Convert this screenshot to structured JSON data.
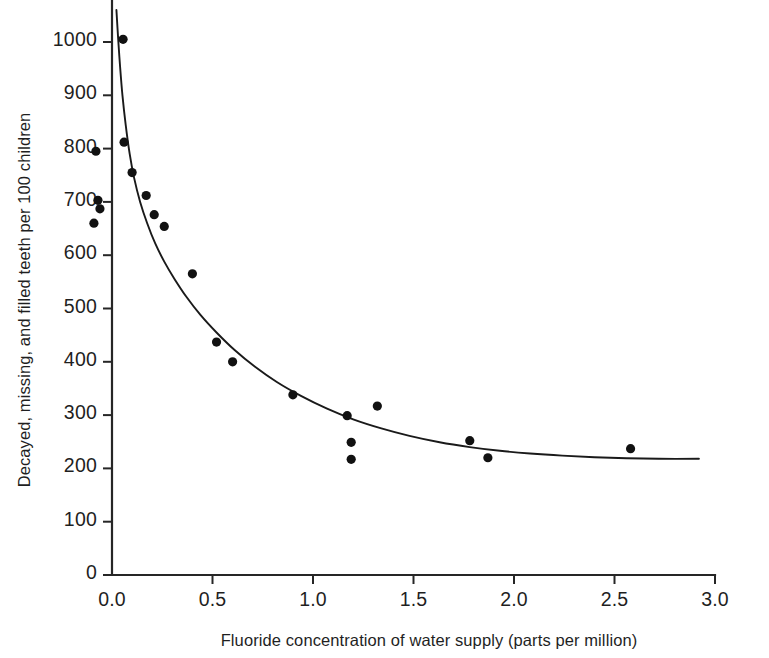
{
  "chart_data": {
    "type": "scatter",
    "title": "",
    "xlabel": "Fluoride concentration of water supply (parts per million)",
    "ylabel": "Decayed, missing, and filled teeth per 100 children",
    "xlim": [
      -0.13,
      3.0
    ],
    "ylim": [
      0,
      1060
    ],
    "grid": false,
    "legend": "none",
    "xticks": [
      0.0,
      0.5,
      1.0,
      1.5,
      2.0,
      2.5,
      3.0
    ],
    "xtick_labels": [
      "0.0",
      "0.5",
      "1.0",
      "1.5",
      "2.0",
      "2.5",
      "3.0"
    ],
    "yticks": [
      0,
      100,
      200,
      300,
      400,
      500,
      600,
      700,
      800,
      900,
      1000
    ],
    "ytick_labels": [
      "0",
      "100",
      "200",
      "300",
      "400",
      "500",
      "600",
      "700",
      "800",
      "900",
      "1000"
    ],
    "x": [
      -0.09,
      -0.08,
      -0.07,
      -0.06,
      0.055,
      0.06,
      0.1,
      0.17,
      0.21,
      0.26,
      0.4,
      0.52,
      0.6,
      0.9,
      1.17,
      1.19,
      1.19,
      1.32,
      1.78,
      1.87,
      2.58
    ],
    "y": [
      660,
      795,
      703,
      687,
      1005,
      812,
      755,
      712,
      676,
      654,
      565,
      437,
      400,
      338,
      299,
      249,
      217,
      317,
      252,
      220,
      237
    ],
    "series": [
      {
        "name": "Observed communities",
        "marker": "filled-circle",
        "color": "#111111",
        "points": [
          {
            "x": -0.09,
            "y": 660
          },
          {
            "x": -0.08,
            "y": 795
          },
          {
            "x": -0.07,
            "y": 703
          },
          {
            "x": -0.06,
            "y": 687
          },
          {
            "x": 0.055,
            "y": 1005
          },
          {
            "x": 0.06,
            "y": 812
          },
          {
            "x": 0.1,
            "y": 755
          },
          {
            "x": 0.17,
            "y": 712
          },
          {
            "x": 0.21,
            "y": 676
          },
          {
            "x": 0.26,
            "y": 654
          },
          {
            "x": 0.4,
            "y": 565
          },
          {
            "x": 0.52,
            "y": 437
          },
          {
            "x": 0.6,
            "y": 400
          },
          {
            "x": 0.9,
            "y": 338
          },
          {
            "x": 1.17,
            "y": 299
          },
          {
            "x": 1.19,
            "y": 249
          },
          {
            "x": 1.19,
            "y": 217
          },
          {
            "x": 1.32,
            "y": 317
          },
          {
            "x": 1.78,
            "y": 252
          },
          {
            "x": 1.87,
            "y": 220
          },
          {
            "x": 2.58,
            "y": 237
          }
        ]
      }
    ],
    "fit_curve": {
      "name": "exponential decay fit",
      "color": "#1a1a1a",
      "points": [
        {
          "x": 0.022,
          "y": 1060
        },
        {
          "x": 0.03,
          "y": 1010
        },
        {
          "x": 0.04,
          "y": 955
        },
        {
          "x": 0.052,
          "y": 900
        },
        {
          "x": 0.068,
          "y": 845
        },
        {
          "x": 0.088,
          "y": 790
        },
        {
          "x": 0.11,
          "y": 745
        },
        {
          "x": 0.14,
          "y": 700
        },
        {
          "x": 0.175,
          "y": 660
        },
        {
          "x": 0.215,
          "y": 622
        },
        {
          "x": 0.26,
          "y": 588
        },
        {
          "x": 0.31,
          "y": 556
        },
        {
          "x": 0.37,
          "y": 522
        },
        {
          "x": 0.44,
          "y": 488
        },
        {
          "x": 0.52,
          "y": 455
        },
        {
          "x": 0.61,
          "y": 422
        },
        {
          "x": 0.71,
          "y": 391
        },
        {
          "x": 0.82,
          "y": 362
        },
        {
          "x": 0.94,
          "y": 336
        },
        {
          "x": 1.07,
          "y": 312
        },
        {
          "x": 1.2,
          "y": 292
        },
        {
          "x": 1.34,
          "y": 275
        },
        {
          "x": 1.48,
          "y": 261
        },
        {
          "x": 1.63,
          "y": 249
        },
        {
          "x": 1.78,
          "y": 240
        },
        {
          "x": 1.93,
          "y": 233
        },
        {
          "x": 2.08,
          "y": 228
        },
        {
          "x": 2.24,
          "y": 224
        },
        {
          "x": 2.4,
          "y": 221
        },
        {
          "x": 2.56,
          "y": 219
        },
        {
          "x": 2.72,
          "y": 218
        },
        {
          "x": 2.92,
          "y": 218
        }
      ]
    }
  },
  "axes": {
    "x_axis_title": "Fluoride concentration of water supply (parts per million)",
    "y_axis_title": "Decayed, missing, and filled teeth per 100 children"
  },
  "colors": {
    "marker": "#111111",
    "curve": "#1a1a1a",
    "axis": "#262626",
    "background": "#ffffff",
    "text": "#1f1f1f"
  }
}
